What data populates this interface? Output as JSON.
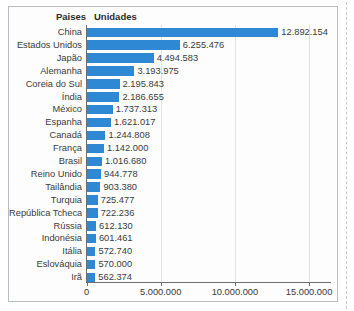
{
  "title_clipped": "Produção mundial de automóveis - 2018 (por unidades)",
  "table_headers": {
    "category": "Paises",
    "value": "Unidades"
  },
  "chart_data": {
    "type": "bar",
    "orientation": "horizontal",
    "title": "Produção mundial de automóveis - 2018 (por unidades)",
    "xlabel": "",
    "ylabel": "",
    "xlim": [
      0,
      15000000
    ],
    "xticks": [
      0,
      5000000,
      10000000,
      15000000
    ],
    "xtick_labels": [
      "0",
      "5.000.000",
      "10.000.000",
      "15.000.000"
    ],
    "grid": true,
    "legend": "none",
    "bar_color": "#2e88d4",
    "categories": [
      "China",
      "Estados Unidos",
      "Japão",
      "Alemanha",
      "Coreia do Sul",
      "Índia",
      "México",
      "Espanha",
      "Canadá",
      "França",
      "Brasil",
      "Reino Unido",
      "Tailândia",
      "Turquia",
      "República Tcheca",
      "Rússia",
      "Indonésia",
      "Itália",
      "Eslováquia",
      "Irã"
    ],
    "values": [
      12892154,
      6255476,
      4494583,
      3193975,
      2195843,
      2186655,
      1737313,
      1621017,
      1244808,
      1142000,
      1016680,
      944778,
      903380,
      725477,
      722236,
      612130,
      601461,
      572740,
      570000,
      562374
    ],
    "value_labels": [
      "12.892.154",
      "6.255.476",
      "4.494.583",
      "3.193.975",
      "2.195.843",
      "2.186.655",
      "1.737.313",
      "1.621.017",
      "1.244.808",
      "1.142.000",
      "1.016.680",
      "944.778",
      "903.380",
      "725.477",
      "722.236",
      "612.130",
      "601.461",
      "572.740",
      "570.000",
      "562.374"
    ]
  }
}
